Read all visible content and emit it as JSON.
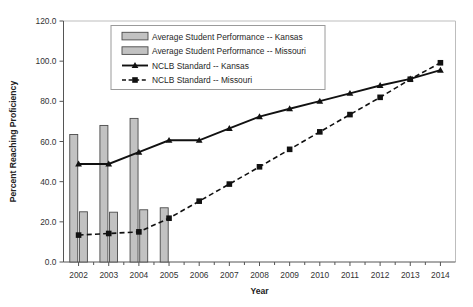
{
  "chart_data": {
    "type": "bar",
    "title": "",
    "subtitle": "",
    "xlabel": "Year",
    "ylabel": "Percent Reaching Proficiency",
    "categories": [
      "2002",
      "2003",
      "2004",
      "2005",
      "2006",
      "2007",
      "2008",
      "2009",
      "2010",
      "2011",
      "2012",
      "2013",
      "2014"
    ],
    "x": [
      2002,
      2003,
      2004,
      2005,
      2006,
      2007,
      2008,
      2009,
      2010,
      2011,
      2012,
      2013,
      2014
    ],
    "xlim": [
      2001.5,
      2014.5
    ],
    "ylim": [
      0.0,
      120.0
    ],
    "yticks": [
      0.0,
      20.0,
      40.0,
      60.0,
      80.0,
      100.0,
      120.0
    ],
    "ytick_labels": [
      "0.0",
      "20.0",
      "40.0",
      "60.0",
      "80.0",
      "100.0",
      "120.0"
    ],
    "grid": false,
    "legend_position": "upper-left-inside",
    "series": [
      {
        "name": "Average Student Performance -- Kansas",
        "type": "bar",
        "marker": "filled-rectangle",
        "values": [
          63.5,
          68.0,
          71.5,
          27.0,
          null,
          null,
          null,
          null,
          null,
          null,
          null,
          null,
          null
        ]
      },
      {
        "name": "Average Student Performance -- Missouri",
        "type": "bar",
        "marker": "filled-rectangle",
        "values": [
          25.0,
          24.8,
          26.0,
          null,
          null,
          null,
          null,
          null,
          null,
          null,
          null,
          null,
          null
        ]
      },
      {
        "name": "NCLB Standard -- Kansas",
        "type": "line",
        "line_style": "solid",
        "marker": "triangle",
        "values": [
          48.8,
          48.8,
          54.7,
          60.6,
          60.6,
          66.5,
          72.4,
          76.3,
          80.1,
          84.0,
          87.9,
          91.2,
          95.5
        ]
      },
      {
        "name": "NCLB Standard -- Missouri",
        "type": "line",
        "line_style": "dashed",
        "marker": "square",
        "values": [
          13.4,
          14.2,
          15.0,
          21.8,
          30.3,
          38.8,
          47.4,
          56.1,
          64.8,
          73.4,
          82.0,
          91.0,
          99.2
        ]
      }
    ],
    "legend_entries": [
      {
        "label": "Average Student Performance -- Kansas",
        "marker": "swatch"
      },
      {
        "label": "Average Student Performance -- Missouri",
        "marker": "swatch"
      },
      {
        "label": "NCLB Standard -- Kansas",
        "marker": "line-solid-triangle"
      },
      {
        "label": "NCLB Standard -- Missouri",
        "marker": "line-dashed-square"
      }
    ],
    "colors": {
      "bar_fill": "#c2c2c2",
      "bar_edge": "#4a4a4a",
      "line": "#111111",
      "axis": "#555555",
      "background": "#ffffff"
    }
  }
}
